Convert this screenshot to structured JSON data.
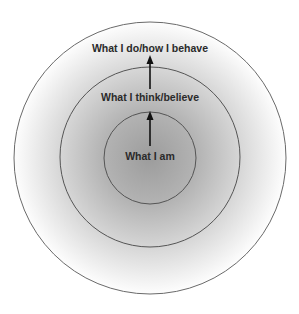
{
  "diagram": {
    "type": "concentric-circles",
    "rings": [
      {
        "id": "outer",
        "label": "What I do/how I behave"
      },
      {
        "id": "middle",
        "label": "What I think/believe"
      },
      {
        "id": "inner",
        "label": "What I am"
      }
    ],
    "arrows": [
      {
        "from": "inner",
        "to": "middle",
        "direction": "up"
      },
      {
        "from": "middle",
        "to": "outer",
        "direction": "up"
      }
    ],
    "colors": {
      "background": "#ffffff",
      "center_shade": "#9a9a9a",
      "edge_shade": "#ffffff",
      "stroke": "#555555",
      "text": "#2a2a2a"
    }
  }
}
